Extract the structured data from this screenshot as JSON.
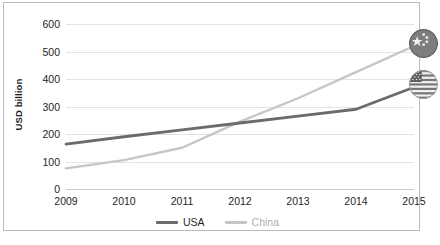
{
  "chart_data": {
    "type": "line",
    "title": "",
    "xlabel": "",
    "ylabel": "USD billion",
    "categories": [
      "2009",
      "2010",
      "2011",
      "2012",
      "2013",
      "2014",
      "2015"
    ],
    "x": [
      2009,
      2010,
      2011,
      2012,
      2013,
      2014,
      2015
    ],
    "series": [
      {
        "name": "USA",
        "color": "#6b6b6b",
        "values": [
          163,
          190,
          215,
          240,
          265,
          290,
          370
        ],
        "end_marker": "usa-flag-icon"
      },
      {
        "name": "China",
        "color": "#c6c6c6",
        "values": [
          75,
          105,
          150,
          245,
          330,
          425,
          520
        ],
        "end_marker": "china-flag-icon"
      }
    ],
    "ylim": [
      0,
      600
    ],
    "yticks": [
      0,
      100,
      200,
      300,
      400,
      500,
      600
    ],
    "ytick_labels": [
      "0",
      "100",
      "200",
      "300",
      "400",
      "500",
      "600"
    ],
    "xlim": [
      2009,
      2015
    ],
    "grid": true,
    "grid_axis": "y",
    "legend_position": "bottom"
  },
  "legend": {
    "items": [
      {
        "label": "USA",
        "color": "#6b6b6b"
      },
      {
        "label": "China",
        "color": "#c6c6c6"
      }
    ]
  },
  "markers": {
    "china": {
      "name": "china-flag-icon",
      "title": "China"
    },
    "usa": {
      "name": "usa-flag-icon",
      "title": "USA"
    }
  },
  "footer": {
    "source": ""
  }
}
